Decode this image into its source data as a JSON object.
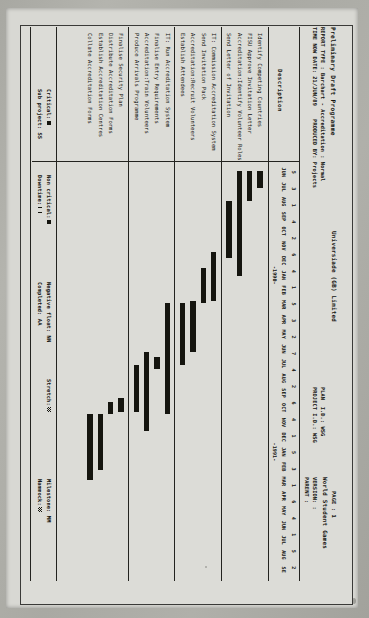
{
  "document": {
    "title": "Preliminary Draft Programme",
    "report_line": "REPORT TYPE : Barchart - Accreditation : Normal",
    "timenow_line": "TIME NOW DATE: 21/JUN/89    PRODUCED BY: Projects",
    "company": "Universiade (GB) Limited",
    "page": "PAGE : 1",
    "project_name": "World Student Games",
    "plan_id": "PLAN  I.D.: WSG",
    "project_id": "PROJECT I.D.: WSG",
    "version": "VERSION: :",
    "parent": "PARENT :"
  },
  "columns": {
    "description_header": "Description"
  },
  "timescale": {
    "year_labels": [
      "1990",
      "1991"
    ],
    "weeks": [
      "5",
      "3",
      "1",
      "4",
      "2",
      "6",
      "4",
      "1",
      "5",
      "3",
      "2",
      "7",
      "4",
      "2",
      "6",
      "4",
      "1",
      "5",
      "3",
      "1",
      "6",
      "4",
      "1",
      "5",
      "2"
    ],
    "months": [
      "JUN",
      "JUL",
      "AUG",
      "SEP",
      "OCT",
      "NOV",
      "DEC",
      "JAN",
      "FEB",
      "MAR",
      "APR",
      "MAY",
      "JUN",
      "JUL",
      "AUG",
      "SEP",
      "OCT",
      "NOV",
      "DEC",
      "JAN",
      "FEB",
      "MAR",
      "APR",
      "MAY",
      "JUN",
      "JUL",
      "AUG",
      "SEP"
    ],
    "month_labels_shown": [
      "JUN",
      "JUL",
      "AUG",
      "SEP",
      "OCT",
      "NOV",
      "DEC",
      "JAN",
      "FEB",
      "MAR",
      "APR",
      "MAY",
      "JUN",
      "JUL",
      "AUG",
      "SEP",
      "OCT",
      "NOV",
      "DEC",
      "JAN",
      "FEB",
      "MAR",
      "APR",
      "MAY",
      "JUN",
      "JUL",
      "AUG",
      "SE"
    ]
  },
  "chart_data": {
    "type": "bar",
    "title": "Preliminary Draft Programme",
    "xlabel": "",
    "ylabel": "",
    "axis_start": "JUN 1989",
    "axis_end": "SEP 1991",
    "groups": [
      {
        "tasks": [
          {
            "name": "Identify Competing Countries",
            "start_pct": 1.5,
            "end_pct": 5.5
          },
          {
            "name": "FISU Approve Invitation Letter",
            "start_pct": 1.5,
            "end_pct": 8.8
          },
          {
            "name": "Accreditation:Identify Volunteer Roles",
            "start_pct": 1.5,
            "end_pct": 27.0
          },
          {
            "name": "Send Letter of Invitation",
            "start_pct": 8.8,
            "end_pct": 22.5
          }
        ]
      },
      {
        "tasks": [
          {
            "name": "IT: Commission Accreditation System",
            "start_pct": 21.0,
            "end_pct": 33.0
          },
          {
            "name": "Send Invitation Pack",
            "start_pct": 25.0,
            "end_pct": 33.5
          },
          {
            "name": "Accreditation:Recruit Volunteers",
            "start_pct": 33.0,
            "end_pct": 45.5
          },
          {
            "name": "Establish Attendees",
            "start_pct": 33.5,
            "end_pct": 48.5
          }
        ]
      },
      {
        "tasks": [
          {
            "name": "IT: Run Accreditation System",
            "start_pct": 33.5,
            "end_pct": 60.5
          },
          {
            "name": "Finalise Entry Requirements",
            "start_pct": 46.5,
            "end_pct": 49.5
          },
          {
            "name": "Accreditation:Train Volunteers",
            "start_pct": 45.5,
            "end_pct": 64.5
          },
          {
            "name": "Produce Arrivals Programme",
            "start_pct": 48.5,
            "end_pct": 60.0
          }
        ]
      },
      {
        "tasks": [
          {
            "name": "Finalise Security Plan",
            "start_pct": 56.5,
            "end_pct": 60.0
          },
          {
            "name": "Distribute Accreditation Forms",
            "start_pct": 57.5,
            "end_pct": 60.5
          },
          {
            "name": "Establish Accreditation Centres",
            "start_pct": 60.5,
            "end_pct": 74.0
          },
          {
            "name": "Collate Accreditation Forms",
            "start_pct": 60.5,
            "end_pct": 76.5
          }
        ]
      }
    ]
  },
  "legend": {
    "critical_label": "Critical:",
    "subproject_label": "Sub project:",
    "subproject_value": "SS",
    "noncritical_label": "Non critical:",
    "downtime_label": "Downtime:",
    "negative_float_label": "Negative float:",
    "negative_float_value": "NN",
    "completed_label": "Completed:",
    "completed_value": "AA",
    "stretch_label": "Stretch:",
    "milestone_label": "Milestone:",
    "milestone_value": "MM",
    "hammock_label": "Hammock:"
  }
}
